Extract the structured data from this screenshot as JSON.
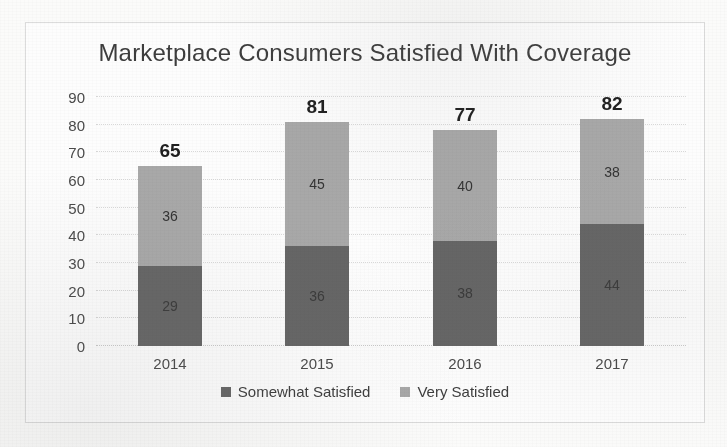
{
  "chart_data": {
    "type": "bar",
    "subtype": "stacked-column",
    "title": "Marketplace Consumers Satisfied With Coverage",
    "xlabel": "",
    "ylabel": "",
    "categories": [
      "2014",
      "2015",
      "2016",
      "2017"
    ],
    "ylim": [
      0,
      90
    ],
    "yticks": [
      "0",
      "10",
      "20",
      "30",
      "40",
      "50",
      "60",
      "70",
      "80",
      "90"
    ],
    "ytick_values": [
      0,
      10,
      20,
      30,
      40,
      50,
      60,
      70,
      80,
      90
    ],
    "grid": true,
    "legend_position": "bottom",
    "series": [
      {
        "name": "Somewhat Satisfied",
        "color": "#656565",
        "values": [
          29,
          36,
          38,
          44
        ],
        "labels": [
          "29",
          "36",
          "38",
          "44"
        ]
      },
      {
        "name": "Very Satisfied",
        "color": "#a8a8a8",
        "values": [
          36,
          45,
          40,
          38
        ],
        "labels": [
          "36",
          "45",
          "40",
          "38"
        ]
      }
    ],
    "totals": [
      65,
      81,
      77,
      82
    ],
    "total_labels": [
      "65",
      "81",
      "77",
      "82"
    ]
  },
  "legend": {
    "items": [
      {
        "label": "Somewhat Satisfied",
        "swatch": "dark"
      },
      {
        "label": "Very Satisfied",
        "swatch": "light"
      }
    ]
  },
  "colors": {
    "somewhat_satisfied": "#656565",
    "very_satisfied": "#a8a8a8",
    "gridline": "#d8d8d8",
    "frame": "#dcdcdc",
    "text": "#404040",
    "background": "#fdfdfd"
  }
}
